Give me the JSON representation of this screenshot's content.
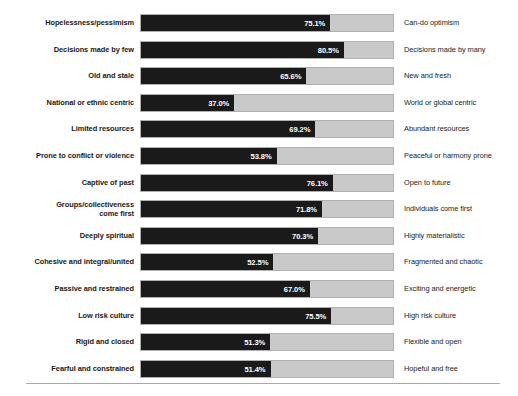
{
  "chart_data": {
    "type": "bar",
    "title": "",
    "subtitle": "",
    "xlabel": "",
    "ylabel": "",
    "xlim": [
      0,
      100
    ],
    "grid": false,
    "legend": null,
    "orientation": "horizontal",
    "value_suffix": "%",
    "categories": [
      "Hopelessness/pessimism",
      "Decisions made by few",
      "Old and stale",
      "National or ethnic centric",
      "Limited resources",
      "Prone to conflict or violence",
      "Captive of past",
      "Groups/collectiveness come first",
      "Deeply spiritual",
      "Cohesive and integral/united",
      "Passive and restrained",
      "Low risk culture",
      "Rigid and closed",
      "Fearful and constrained"
    ],
    "right_categories": [
      "Can-do optimism",
      "Decisions made by many",
      "New and fresh",
      "World or global centric",
      "Abundant resources",
      "Peaceful or harmony prone",
      "Open to future",
      "Individuals come first",
      "Highly materialistic",
      "Fragmented and chaotic",
      "Exciting and energetic",
      "High risk culture",
      "Flexible and open",
      "Hopeful and free"
    ],
    "values": [
      75.1,
      80.5,
      65.6,
      37.0,
      69.2,
      53.8,
      76.1,
      71.8,
      70.3,
      52.5,
      67.0,
      75.5,
      51.3,
      51.4
    ],
    "value_labels": [
      "75.1%",
      "80.5%",
      "65.6%",
      "37.0%",
      "69.2%",
      "53.8%",
      "76.1%",
      "71.8%",
      "70.3%",
      "52.5%",
      "67.0%",
      "75.5%",
      "51.3%",
      "51.4%"
    ],
    "colors": {
      "fill": "#1a1a1a",
      "track": "#c9c9c9",
      "track_border": "#b0b0b0",
      "value_text": "#ffffff",
      "label_text": "#1b1b1b",
      "background": "#ffffff",
      "rule": "#a9a9a9"
    }
  },
  "rows": [
    {
      "left": "Hopelessness/pessimism",
      "right": "Can-do optimism",
      "value": 75.1,
      "label": "75.1%",
      "lines": 1
    },
    {
      "left": "Decisions made by few",
      "right": "Decisions made by many",
      "value": 80.5,
      "label": "80.5%",
      "lines": 1
    },
    {
      "left": "Old and stale",
      "right": "New and fresh",
      "value": 65.6,
      "label": "65.6%",
      "lines": 1
    },
    {
      "left": "National or ethnic centric",
      "right": "World or global centric",
      "value": 37.0,
      "label": "37.0%",
      "lines": 1
    },
    {
      "left": "Limited resources",
      "right": "Abundant resources",
      "value": 69.2,
      "label": "69.2%",
      "lines": 1
    },
    {
      "left": "Prone to conflict or violence",
      "right": "Peaceful or harmony prone",
      "value": 53.8,
      "label": "53.8%",
      "lines": 1
    },
    {
      "left": "Captive of past",
      "right": "Open to future",
      "value": 76.1,
      "label": "76.1%",
      "lines": 1
    },
    {
      "left": "Groups/collectiveness\ncome first",
      "right": "Individuals come first",
      "value": 71.8,
      "label": "71.8%",
      "lines": 2
    },
    {
      "left": "Deeply spiritual",
      "right": "Highly materialistic",
      "value": 70.3,
      "label": "70.3%",
      "lines": 1
    },
    {
      "left": "Cohesive and integral/united",
      "right": "Fragmented and chaotic",
      "value": 52.5,
      "label": "52.5%",
      "lines": 1
    },
    {
      "left": "Passive and restrained",
      "right": "Exciting and energetic",
      "value": 67.0,
      "label": "67.0%",
      "lines": 1
    },
    {
      "left": "Low risk culture",
      "right": "High risk culture",
      "value": 75.5,
      "label": "75.5%",
      "lines": 1
    },
    {
      "left": "Rigid and closed",
      "right": "Flexible and open",
      "value": 51.3,
      "label": "51.3%",
      "lines": 1
    },
    {
      "left": "Fearful and constrained",
      "right": "Hopeful and free",
      "value": 51.4,
      "label": "51.4%",
      "lines": 1
    }
  ]
}
